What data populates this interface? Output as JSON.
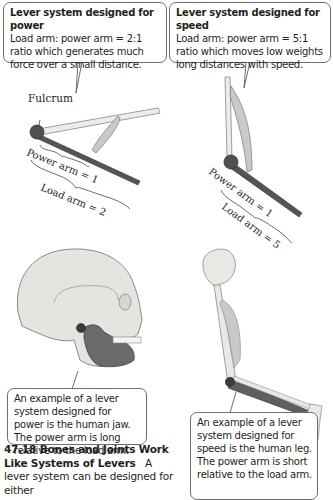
{
  "callouts": {
    "power_system": {
      "title": "Lever system designed for power",
      "body": "Load arm: power arm = 2:1 ratio which generates much force over a small distance."
    },
    "speed_system": {
      "title": "Lever system designed for speed",
      "body": "Load arm: power arm = 5:1 ratio which moves low weights long distances with speed."
    },
    "jaw_example": {
      "body": "An example of a lever system designed for power is the human jaw. The power arm is long relative to the load arm."
    },
    "leg_example": {
      "body": "An example of a lever system designed for speed is the human leg. The power arm is short relative to the load arm."
    }
  },
  "diagram_labels": {
    "fulcrum": "Fulcrum",
    "power_lever": {
      "power_arm": "Power arm = 1",
      "load_arm": "Load arm = 2"
    },
    "speed_lever": {
      "power_arm": "Power arm = 1",
      "load_arm": "Load arm = 5"
    }
  },
  "section": {
    "heading": "47.18  Bones and Joints Work Like Systems of Levers",
    "text": "A lever system can be designed for either"
  },
  "colors": {
    "bone": "#e6e6e2",
    "muscle": "#c8c8c8",
    "dark_lever": "#5a5a5a",
    "fulcrum": "#4a4a4a",
    "border": "#6d6e70"
  }
}
